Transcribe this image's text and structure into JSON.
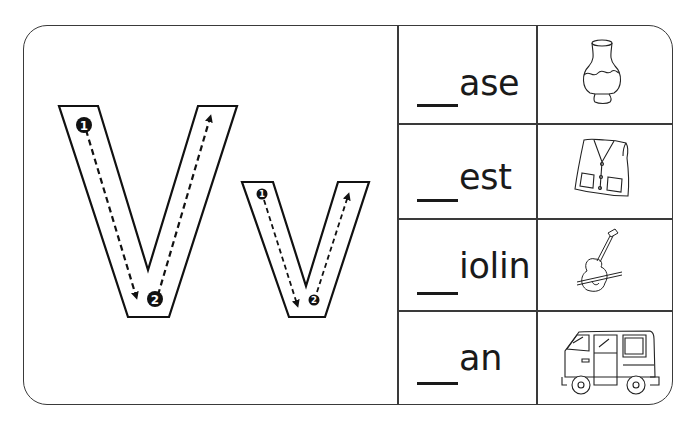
{
  "worksheet": {
    "letter_upper": "V",
    "letter_lower": "v",
    "stroke_numbers": [
      "1",
      "2"
    ],
    "colors": {
      "line": "#3a3a3a",
      "ink": "#1a1a1a",
      "background": "#ffffff"
    }
  },
  "words": [
    {
      "blank": "__",
      "suffix": "ase",
      "picture": "vase-icon"
    },
    {
      "blank": "__",
      "suffix": "est",
      "picture": "vest-icon"
    },
    {
      "blank": "__",
      "suffix": "iolin",
      "picture": "violin-icon"
    },
    {
      "blank": "__",
      "suffix": "an",
      "picture": "van-icon"
    }
  ]
}
